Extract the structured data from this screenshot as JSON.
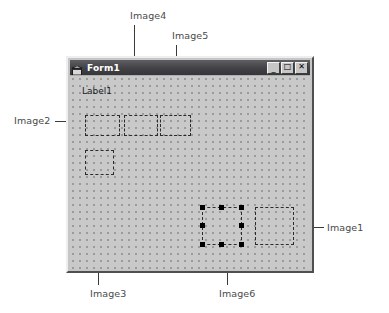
{
  "page": {
    "background_color": "#ffffff",
    "width": 389,
    "height": 313
  },
  "form_window": {
    "title": "Form1",
    "icon_name": "vb-form-icon",
    "background_color": "#c6c6c6",
    "titlebar_color": "#414146",
    "canvas_color": "#c9c9c9",
    "grid_dot_color": "#9b9b9b",
    "buttons": [
      {
        "name": "minimize-button",
        "glyph": "_"
      },
      {
        "name": "maximize-button",
        "glyph": "□"
      },
      {
        "name": "close-button",
        "glyph": "✕"
      }
    ]
  },
  "controls": {
    "label1": {
      "name": "Label1",
      "text": "Label1",
      "x": 12,
      "y": 10
    },
    "images": [
      {
        "name": "Image2",
        "x": 15,
        "y": 39,
        "width": 35,
        "height": 21,
        "selected": false
      },
      {
        "name": "Image4",
        "x": 54,
        "y": 39,
        "width": 34,
        "height": 21,
        "selected": false
      },
      {
        "name": "Image5",
        "x": 90,
        "y": 39,
        "width": 31,
        "height": 21,
        "selected": false
      },
      {
        "name": "Image3",
        "x": 15,
        "y": 74,
        "width": 29,
        "height": 25,
        "selected": false
      },
      {
        "name": "Image6",
        "x": 132,
        "y": 131,
        "width": 40,
        "height": 38,
        "selected": true
      },
      {
        "name": "Image1",
        "x": 185,
        "y": 131,
        "width": 39,
        "height": 38,
        "selected": false
      }
    ]
  },
  "annotations": [
    {
      "name": "Image4",
      "text": "Image4",
      "label_x": 130,
      "label_y": 10
    },
    {
      "name": "Image5",
      "text": "Image5",
      "label_x": 172,
      "label_y": 30
    },
    {
      "name": "Image2",
      "text": "Image2",
      "label_x": 14,
      "label_y": 115
    },
    {
      "name": "Image1",
      "text": "Image1",
      "label_x": 327,
      "label_y": 222
    },
    {
      "name": "Image3",
      "text": "Image3",
      "label_x": 90,
      "label_y": 288
    },
    {
      "name": "Image6",
      "text": "Image6",
      "label_x": 219,
      "label_y": 288
    }
  ],
  "colors": {
    "leader_line": "#3a3a3a",
    "annotation_text": "#4a4a4a",
    "control_outline": "#2b2b2b",
    "handle": "#000000"
  }
}
